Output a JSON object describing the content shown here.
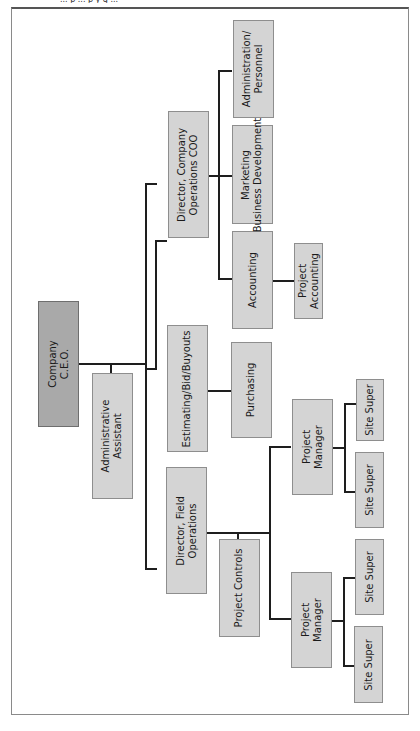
{
  "header": {
    "cut_text": "... p ... p y g ..."
  },
  "chart": {
    "orientation": "rotated-90-ccw",
    "nodes": {
      "ceo": "Company\nC.E.O.",
      "admin_assistant": "Administrative\nAssistant",
      "director_field": "Director, Field\nOperations",
      "estimating": "Estimating/Bid/Buyouts",
      "director_coo": "Director, Company\nOperations COO",
      "purchasing": "Purchasing",
      "accounting": "Accounting",
      "project_accounting": "Project\nAccounting",
      "marketing": "Marketing\nBusiness Development",
      "administration": "Administration/\nPersonnel",
      "project_controls": "Project Controls",
      "pm1": "Project\nManager",
      "pm2": "Project\nManager",
      "site1": "Site Super",
      "site2": "Site Super",
      "site3": "Site Super",
      "site4": "Site Super"
    }
  }
}
